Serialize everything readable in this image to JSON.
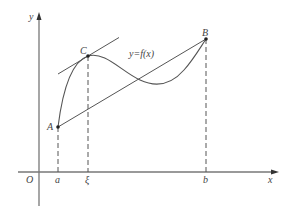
{
  "diagram": {
    "colors": {
      "stroke": "#555555",
      "axis": "#777777",
      "text": "#444444",
      "background": "#ffffff"
    },
    "axes": {
      "x_label": "x",
      "y_label": "y",
      "origin_label": "O"
    },
    "points": {
      "A": {
        "label": "A"
      },
      "B": {
        "label": "B"
      },
      "C": {
        "label": "C"
      }
    },
    "ticks": {
      "a": "a",
      "xi": "ξ",
      "b": "b"
    },
    "curve_label": "y=f(x)",
    "elements": [
      "curve y=f(x) from A to B",
      "chord AB",
      "tangent line at C parallel to AB",
      "dashed verticals from A, C, B to x-axis"
    ]
  }
}
